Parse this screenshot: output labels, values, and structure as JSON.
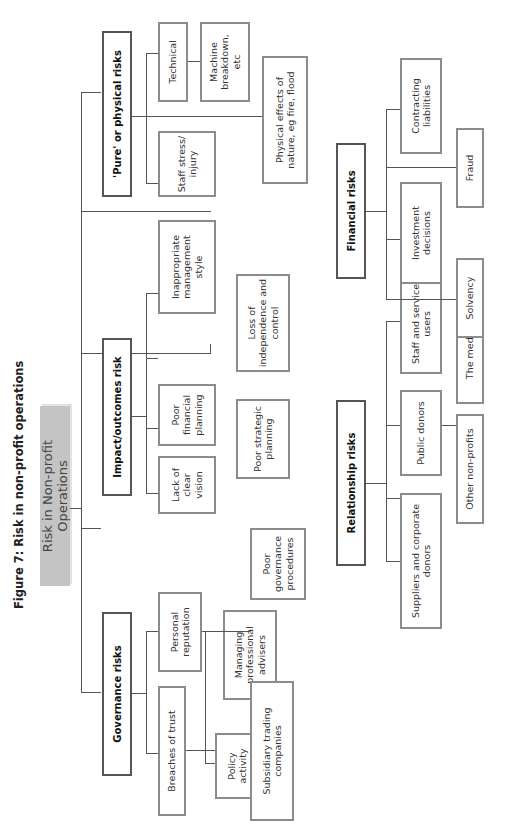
{
  "figure_title": "Figure 7: Risk in non-profit operations",
  "root": "Risk in Non-profit Operations",
  "categories": {
    "governance": {
      "label": "Governance risks",
      "children": {
        "breaches": "Breaches of trust",
        "policy": "Policy activity",
        "advisers": "Managing professional advisers",
        "subsidiary": "Subsidiary trading companies",
        "reputation": "Personal reputation",
        "procedures": "Poor governance procedures"
      }
    },
    "impact": {
      "label": "Impact/outcomes risk",
      "children": {
        "vision": "Lack of clear vision",
        "strategic": "Poor strategic planning",
        "financial_planning": "Poor financial planning",
        "independence": "Loss of independence and control",
        "management": "Inappropriate management style"
      }
    },
    "pure": {
      "label": "'Pure' or physical risks",
      "children": {
        "staff_stress": "Staff stress/ injury",
        "nature": "Physical effects of nature, eg fire, flood",
        "technical": "Technical",
        "machine": "Machine breakdown, etc"
      }
    },
    "relationship": {
      "label": "Relationship risks",
      "children": {
        "suppliers": "Suppliers and corporate donors",
        "other_np": "Other non-profits",
        "public": "Public donors",
        "media": "The media",
        "staff_users": "Staff and service users"
      }
    },
    "financial": {
      "label": "Financial risks",
      "children": {
        "solvency": "Solvency",
        "investment": "Investment decisions",
        "fraud": "Fraud",
        "contracting": "Contracting liabilities"
      }
    }
  }
}
